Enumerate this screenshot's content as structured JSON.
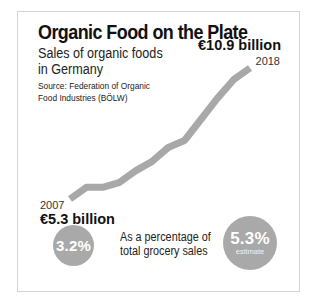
{
  "header": {
    "title": "Organic Food on the Plate",
    "subtitle_line1": "Sales of organic foods",
    "subtitle_line2": "in Germany",
    "source_line1": "Source: Federation of Organic",
    "source_line2": "Food Industries (BÖLW)"
  },
  "annotations": {
    "start_year": "2007",
    "start_value": "€5.3 billion",
    "end_year": "2018",
    "end_value": "€10.9 billion"
  },
  "share": {
    "label_line1": "As a percentage of",
    "label_line2": "total grocery sales",
    "start_pct": "3.2%",
    "end_pct": "5.3%",
    "end_note": "estimate"
  },
  "colors": {
    "line": "#a8a8a8",
    "circle": "#a9a9a9",
    "frame": "#d4d4d4",
    "text": "#111111"
  },
  "chart_data": {
    "type": "line",
    "title": "Organic Food on the Plate",
    "subtitle": "Sales of organic foods in Germany",
    "source": "Source: Federation of Organic Food Industries (BÖLW)",
    "xlabel": "",
    "ylabel": "Sales (€ billion)",
    "x": [
      2007,
      2008,
      2009,
      2010,
      2011,
      2012,
      2013,
      2014,
      2015,
      2016,
      2017,
      2018
    ],
    "series": [
      {
        "name": "Organic food sales (€ billion)",
        "values": [
          5.3,
          5.8,
          5.8,
          6.0,
          6.5,
          6.9,
          7.5,
          7.8,
          8.7,
          9.6,
          10.4,
          10.9
        ]
      }
    ],
    "labeled_points": [
      {
        "x": 2007,
        "label": "€5.3 billion"
      },
      {
        "x": 2018,
        "label": "€10.9 billion"
      }
    ],
    "share_of_grocery_sales": [
      {
        "year": 2007,
        "value": 3.2,
        "label": "3.2%"
      },
      {
        "year": 2018,
        "value": 5.3,
        "label": "5.3%",
        "note": "estimate"
      }
    ],
    "ylim": [
      5.3,
      10.9
    ],
    "grid": false,
    "axes_visible": false,
    "legend": "none"
  }
}
